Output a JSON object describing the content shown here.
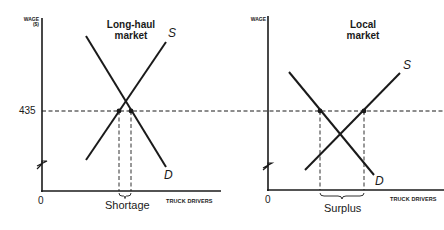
{
  "left_panel": {
    "title_line1": "Long-haul",
    "title_line2": "market",
    "y_axis_label_line1": "WAGE",
    "y_axis_label_line2": "($)",
    "x_axis_label": "TRUCK DRIVERS",
    "origin_label": "0",
    "wage_tick": "435",
    "supply_label": "S",
    "demand_label": "D",
    "gap_label": "Shortage"
  },
  "right_panel": {
    "title_line1": "Local",
    "title_line2": "market",
    "y_axis_label": "WAGE",
    "x_axis_label": "TRUCK DRIVERS",
    "origin_label": "0",
    "supply_label": "S",
    "demand_label": "D",
    "gap_label": "Surplus"
  },
  "colors": {
    "ink": "#1a1a1a",
    "background": "#ffffff"
  }
}
